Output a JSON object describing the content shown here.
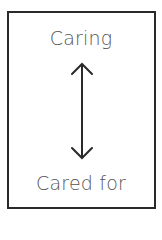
{
  "diagram": {
    "top_label": "Caring",
    "bottom_label": "Cared for",
    "connector": "bidirectional-vertical-arrow",
    "colors": {
      "border": "#2a2a2a",
      "text": "#555555",
      "arrow": "#2a2a2a",
      "background": "#ffffff"
    }
  }
}
